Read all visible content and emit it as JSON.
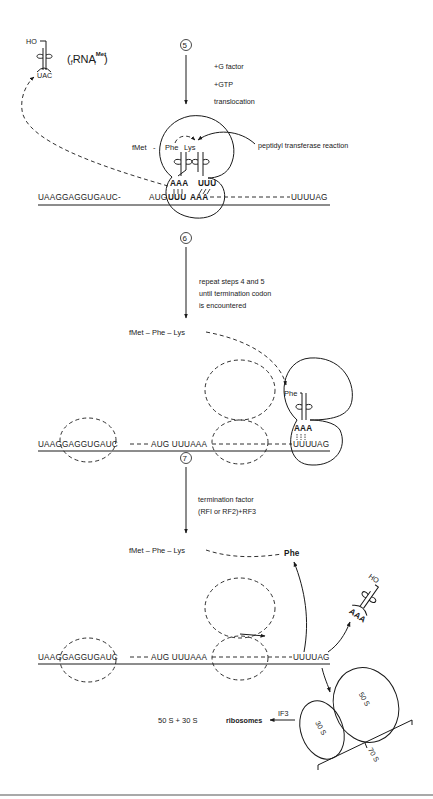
{
  "figure": {
    "type": "protein synthesis elongation and termination diagram",
    "steps": [
      {
        "number": "⑤",
        "conditions": [
          "+G factor",
          "+GTP",
          "translocation"
        ]
      },
      {
        "number": "⑥",
        "conditions": [
          "repeat steps 4 and 5",
          "until termination codon",
          "is encountered"
        ]
      },
      {
        "number": "⑦",
        "conditions": [
          "termination factor",
          "(RFI or RF2)+RF3"
        ]
      }
    ],
    "released_trna": {
      "hydroxyl": "HO",
      "anticodon": "UAC",
      "name_prefix": "(",
      "name_sub_pre": "f",
      "name_main": "RNA",
      "name_sup": "Met",
      "name_sub": "f",
      "name_suffix": ")"
    },
    "panel1": {
      "peptide_fmet": "fMet",
      "peptide_dash": "-",
      "peptide_phe": "Phe",
      "peptide_lys": "Lys",
      "annotation": "peptidyl transferase reaction",
      "anticodon1": "AAA",
      "anticodon2": "UUU",
      "mrna_left": "UAAGGAGGUGAUC-",
      "mrna_aug": "AUG",
      "mrna_codon1": "UUU",
      "mrna_codon2": "AAA",
      "mrna_right": "UUUUAG"
    },
    "panel2": {
      "peptide": "fMet – Phe – Lys",
      "trna_aa": "Phe",
      "anticodon": "AAA",
      "mrna_left": "UAAGGAGGUGAUC",
      "mrna_mid": "AUG UUUAAA",
      "mrna_codon": "UUU",
      "mrna_stop": "UAG"
    },
    "panel3": {
      "peptide": "fMet – Phe – Lys",
      "released_aa": "Phe",
      "trna_hydroxyl": "HO",
      "trna_anticodon": "AAA",
      "mrna_left": "UAAGGAGGUGAUC",
      "mrna_mid": "AUG UUUAAA",
      "mrna_right": "UUUUAG",
      "ribosome_large": "50 S",
      "ribosome_small": "30 S",
      "ribosome_complex": "70 S",
      "dissociation_factor": "IF3",
      "products": "50 S + 30 S",
      "products_label": "ribosomes"
    }
  }
}
